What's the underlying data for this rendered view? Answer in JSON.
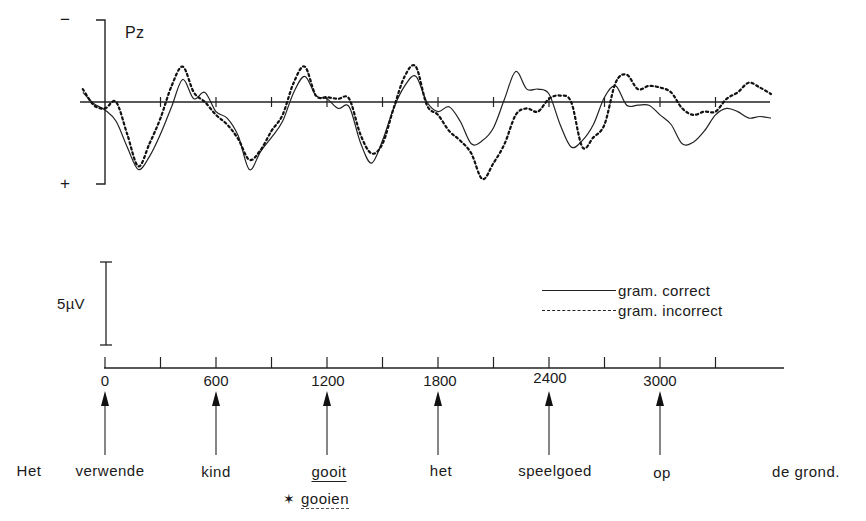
{
  "chart_data": {
    "type": "line",
    "title": "",
    "electrode_label": "Pz",
    "polarity": {
      "top": "−",
      "bottom": "+"
    },
    "xlabel": "Time (ms)",
    "ylabel": "Amplitude (µV), negative up",
    "x_ticks": [
      0,
      600,
      1200,
      1800,
      2400,
      3000
    ],
    "x_minor_ticks": [
      300,
      900,
      1500,
      2100,
      2700,
      3300
    ],
    "xlim": [
      -120,
      3650
    ],
    "scale_bar": "5µV",
    "legend": [
      {
        "name": "gram. correct",
        "style": "solid"
      },
      {
        "name": "gram. incorrect",
        "style": "dashed"
      }
    ],
    "legend_position": "right, below waveforms",
    "series": [
      {
        "name": "gram. correct",
        "style": "solid",
        "x": [
          -120,
          -60,
          0,
          60,
          120,
          180,
          240,
          300,
          360,
          420,
          480,
          540,
          600,
          660,
          720,
          780,
          840,
          900,
          960,
          1020,
          1080,
          1140,
          1200,
          1260,
          1320,
          1380,
          1440,
          1500,
          1560,
          1620,
          1680,
          1740,
          1800,
          1860,
          1920,
          1980,
          2040,
          2100,
          2160,
          2220,
          2280,
          2340,
          2400,
          2460,
          2520,
          2580,
          2640,
          2700,
          2760,
          2820,
          2880,
          2940,
          3000,
          3060,
          3120,
          3180,
          3240,
          3300,
          3360,
          3420,
          3480,
          3540,
          3600
        ],
        "y": [
          0.6,
          -0.1,
          -0.5,
          -1.2,
          -2.8,
          -4.2,
          -3.4,
          -2.0,
          -0.3,
          1.4,
          0.2,
          0.6,
          -0.6,
          -1.0,
          -2.1,
          -4.2,
          -3.1,
          -2.2,
          -1.2,
          0.6,
          1.6,
          0.4,
          0.2,
          -0.4,
          -0.3,
          -2.5,
          -3.8,
          -2.4,
          -0.4,
          1.0,
          1.6,
          0.0,
          -0.6,
          -0.3,
          -1.2,
          -2.6,
          -2.4,
          -1.6,
          0.2,
          1.9,
          0.8,
          0.8,
          0.5,
          -1.4,
          -2.8,
          -2.4,
          -1.4,
          0.3,
          1.0,
          -0.2,
          -0.2,
          -0.2,
          -0.8,
          -1.4,
          -2.6,
          -2.5,
          -1.8,
          -0.8,
          -0.4,
          -0.6,
          -1.0,
          -0.9,
          -1.0
        ]
      },
      {
        "name": "gram. incorrect",
        "style": "dashed",
        "x": [
          -120,
          -60,
          0,
          60,
          120,
          180,
          240,
          300,
          360,
          420,
          480,
          540,
          600,
          660,
          720,
          780,
          840,
          900,
          960,
          1020,
          1080,
          1140,
          1200,
          1260,
          1320,
          1380,
          1440,
          1500,
          1560,
          1620,
          1680,
          1740,
          1800,
          1860,
          1920,
          1980,
          2040,
          2100,
          2160,
          2220,
          2280,
          2340,
          2400,
          2460,
          2520,
          2580,
          2640,
          2700,
          2760,
          2820,
          2880,
          2940,
          3000,
          3060,
          3120,
          3180,
          3240,
          3300,
          3360,
          3420,
          3480,
          3540,
          3600
        ],
        "y": [
          0.8,
          -0.2,
          -0.4,
          0.0,
          -2.0,
          -4.0,
          -2.6,
          -1.0,
          1.0,
          2.2,
          0.6,
          0.0,
          -0.8,
          -1.4,
          -2.3,
          -3.6,
          -3.0,
          -1.8,
          -0.8,
          1.2,
          2.2,
          0.4,
          0.3,
          0.2,
          0.2,
          -2.0,
          -3.2,
          -2.6,
          -0.4,
          1.6,
          2.2,
          -0.2,
          -0.8,
          -1.8,
          -2.4,
          -3.2,
          -4.8,
          -3.8,
          -2.6,
          -0.8,
          -0.4,
          -0.6,
          0.2,
          0.4,
          0.0,
          -2.8,
          -2.2,
          -1.4,
          1.2,
          1.7,
          0.8,
          1.0,
          0.9,
          0.6,
          -0.4,
          -0.8,
          -0.6,
          -0.6,
          0.2,
          0.6,
          1.2,
          0.9,
          0.5
        ]
      }
    ]
  },
  "axis": {
    "tick_labels": [
      "0",
      "600",
      "1200",
      "1800",
      "2400",
      "3000"
    ],
    "scale_bar_label": "5µV",
    "minus_label": "−",
    "plus_label": "+",
    "electrode": "Pz"
  },
  "legend": {
    "correct": "gram. correct",
    "incorrect": "gram. incorrect"
  },
  "sentence": {
    "words": [
      "Het",
      "verwende",
      "kind",
      "gooit",
      "het",
      "speelgoed",
      "op",
      "de grond."
    ],
    "incorrect_variant": "gooien",
    "incorrect_marker": "✶"
  }
}
